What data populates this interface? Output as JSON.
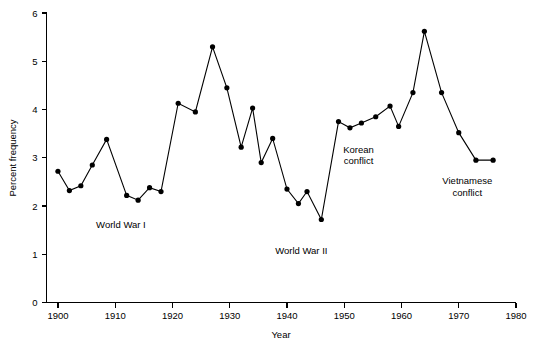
{
  "chart_data": {
    "type": "line",
    "title": "",
    "xlabel": "Year",
    "ylabel": "Percent frequency",
    "xlim": [
      1898,
      1980
    ],
    "ylim": [
      0,
      6
    ],
    "xticks": [
      1900,
      1910,
      1920,
      1930,
      1940,
      1950,
      1960,
      1970,
      1980
    ],
    "xtick_labels": [
      "1900",
      "1910",
      "1920",
      "1930",
      "1940",
      "1950",
      "1960",
      "1970",
      "1980"
    ],
    "yticks": [
      0,
      1,
      2,
      3,
      4,
      5,
      6
    ],
    "ytick_labels": [
      "0",
      "1",
      "2",
      "3",
      "4",
      "5",
      "6"
    ],
    "grid": false,
    "legend": false,
    "marker": "filled-circle",
    "line_color": "#000000",
    "marker_color": "#000000",
    "x": [
      1900,
      1902,
      1904,
      1906,
      1908,
      1910,
      1912,
      1914,
      1916,
      1918,
      1920,
      1922,
      1924,
      1926,
      1928,
      1930,
      1932,
      1934,
      1936,
      1938,
      1940,
      1942,
      1944,
      1946,
      1948,
      1950,
      1952,
      1954,
      1956,
      1958,
      1960,
      1962,
      1964,
      1966,
      1968,
      1970,
      1972,
      1974,
      1976
    ],
    "values": [
      2.72,
      2.32,
      2.42,
      2.85,
      3.38,
      2.22,
      2.12,
      2.35,
      2.4,
      2.25,
      4.13,
      3.95,
      4.6,
      5.3,
      4.45,
      3.22,
      3.73,
      4.03,
      2.9,
      3.4,
      2.35,
      2.05,
      2.3,
      1.72,
      3.75,
      3.62,
      3.72,
      3.85,
      4.07,
      3.65,
      4.35,
      5.62,
      4.35,
      3.52,
      2.95,
      2.95,
      2.95,
      2.95,
      2.95
    ],
    "series": [
      {
        "name": "Percent frequency",
        "points": [
          {
            "x": 1900,
            "y": 2.72
          },
          {
            "x": 1902,
            "y": 2.32
          },
          {
            "x": 1904,
            "y": 2.42
          },
          {
            "x": 1906,
            "y": 2.85
          },
          {
            "x": 1908.5,
            "y": 3.38
          },
          {
            "x": 1912,
            "y": 2.22
          },
          {
            "x": 1914,
            "y": 2.12
          },
          {
            "x": 1916,
            "y": 2.38
          },
          {
            "x": 1918,
            "y": 2.3
          },
          {
            "x": 1921,
            "y": 4.13
          },
          {
            "x": 1924,
            "y": 3.95
          },
          {
            "x": 1927,
            "y": 5.3
          },
          {
            "x": 1929.5,
            "y": 4.45
          },
          {
            "x": 1932,
            "y": 3.22
          },
          {
            "x": 1934,
            "y": 4.03
          },
          {
            "x": 1935.5,
            "y": 2.9
          },
          {
            "x": 1937.5,
            "y": 3.4
          },
          {
            "x": 1940,
            "y": 2.35
          },
          {
            "x": 1942,
            "y": 2.05
          },
          {
            "x": 1943.5,
            "y": 2.3
          },
          {
            "x": 1946,
            "y": 1.72
          },
          {
            "x": 1949,
            "y": 3.75
          },
          {
            "x": 1951,
            "y": 3.62
          },
          {
            "x": 1953,
            "y": 3.72
          },
          {
            "x": 1955.5,
            "y": 3.85
          },
          {
            "x": 1958,
            "y": 4.07
          },
          {
            "x": 1959.5,
            "y": 3.65
          },
          {
            "x": 1962,
            "y": 4.35
          },
          {
            "x": 1964,
            "y": 5.62
          },
          {
            "x": 1967,
            "y": 4.35
          },
          {
            "x": 1970,
            "y": 3.52
          },
          {
            "x": 1973,
            "y": 2.95
          },
          {
            "x": 1976,
            "y": 2.95
          }
        ]
      }
    ],
    "annotations": [
      {
        "text": "World War I",
        "x": 1911,
        "y": 1.55
      },
      {
        "text": "World War II",
        "x": 1942.5,
        "y": 1.0
      },
      {
        "text": "Korean conflict",
        "lines": [
          "Korean",
          "conflict"
        ],
        "x": 1952.5,
        "y": 3.1
      },
      {
        "text": "Vietnamese conflict",
        "lines": [
          "Vietnamese",
          "conflict"
        ],
        "x": 1971.5,
        "y": 2.45
      }
    ]
  }
}
